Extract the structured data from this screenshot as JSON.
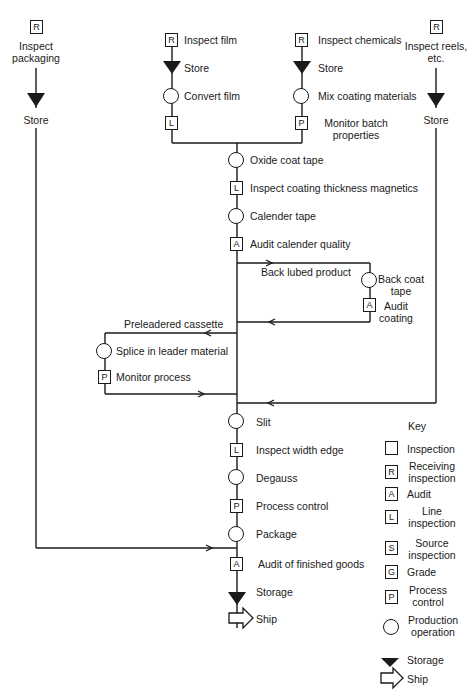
{
  "inputs": {
    "packaging": {
      "symbol": "R",
      "label_line1": "Inspect",
      "label_line2": "packaging",
      "store_label": "Store"
    },
    "film": {
      "symbol": "R",
      "label": "Inspect film",
      "store_label": "Store",
      "operation": "Convert film",
      "check_symbol": "L"
    },
    "chemicals": {
      "symbol": "R",
      "label": "Inspect chemicals",
      "store_label": "Store",
      "operation": "Mix coating materials",
      "check_symbol": "P",
      "check_line1": "Monitor batch",
      "check_line2": "properties"
    },
    "reels": {
      "symbol": "R",
      "label_line1": "Inspect reels,",
      "label_line2": "etc.",
      "store_label": "Store"
    }
  },
  "main_flow": [
    {
      "type": "operation",
      "label": "Oxide coat tape"
    },
    {
      "type": "inspection",
      "symbol": "L",
      "label": "Inspect coating thickness magnetics"
    },
    {
      "type": "operation",
      "label": "Calender tape"
    },
    {
      "type": "inspection",
      "symbol": "A",
      "label": "Audit calender quality"
    },
    {
      "type": "operation",
      "label": "Slit"
    },
    {
      "type": "inspection",
      "symbol": "L",
      "label": "Inspect width edge"
    },
    {
      "type": "operation",
      "label": "Degauss"
    },
    {
      "type": "inspection",
      "symbol": "P",
      "label": "Process control"
    },
    {
      "type": "operation",
      "label": "Package"
    },
    {
      "type": "inspection",
      "symbol": "A",
      "label": "Audit of finished goods"
    },
    {
      "type": "storage",
      "label": "Storage"
    },
    {
      "type": "ship",
      "label": "Ship"
    }
  ],
  "branches": {
    "back_lube": {
      "branch_label": "Back lubed product",
      "operation_line1": "Back coat",
      "operation_line2": "tape",
      "check_symbol": "A",
      "check_line1": "Audit",
      "check_line2": "coating"
    },
    "preleader": {
      "branch_label": "Preleadered cassette",
      "operation": "Splice in leader material",
      "check_symbol": "P",
      "check_label": "Monitor process"
    }
  },
  "key": {
    "title": "Key",
    "items": [
      {
        "symbol": "",
        "shape": "square",
        "label_line1": "Inspection",
        "label_line2": ""
      },
      {
        "symbol": "R",
        "shape": "square",
        "label_line1": "Receiving",
        "label_line2": "inspection"
      },
      {
        "symbol": "A",
        "shape": "square",
        "label_line1": "Audit",
        "label_line2": ""
      },
      {
        "symbol": "L",
        "shape": "square",
        "label_line1": "Line",
        "label_line2": "inspection"
      },
      {
        "symbol": "S",
        "shape": "square",
        "label_line1": "Source",
        "label_line2": "inspection"
      },
      {
        "symbol": "G",
        "shape": "square",
        "label_line1": "Grade",
        "label_line2": ""
      },
      {
        "symbol": "P",
        "shape": "square",
        "label_line1": "Process",
        "label_line2": "control"
      },
      {
        "symbol": "",
        "shape": "circle",
        "label_line1": "Production",
        "label_line2": "operation"
      },
      {
        "symbol": "",
        "shape": "triangle",
        "label_line1": "Storage",
        "label_line2": ""
      },
      {
        "symbol": "",
        "shape": "arrow",
        "label_line1": "Ship",
        "label_line2": ""
      }
    ]
  },
  "colors": {
    "ink": "#1a1a1a",
    "background": "#ffffff"
  }
}
